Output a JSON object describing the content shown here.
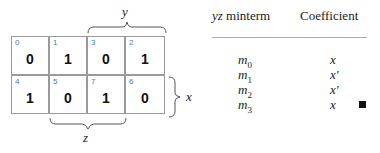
{
  "kmap": {
    "rows": [
      [
        {
          "index": "0",
          "value": "0"
        },
        {
          "index": "1",
          "value": "1"
        },
        {
          "index": "3",
          "value": "0"
        },
        {
          "index": "2",
          "value": "1"
        }
      ],
      [
        {
          "index": "4",
          "value": "1"
        },
        {
          "index": "5",
          "value": "0"
        },
        {
          "index": "7",
          "value": "1"
        },
        {
          "index": "6",
          "value": "0"
        }
      ]
    ],
    "labels": {
      "y": "y",
      "x": "x",
      "z": "z"
    },
    "colors": {
      "index": "#4a78c2",
      "grid": "#9a9a9a"
    }
  },
  "table": {
    "headers": {
      "col1_var": "yz",
      "col1_rest": " minterm",
      "col2": "Coefficient"
    },
    "rule_color": "#8fb3cf",
    "rows": [
      {
        "m": "m",
        "sub": "0",
        "coef": "x"
      },
      {
        "m": "m",
        "sub": "1",
        "coef": "x′"
      },
      {
        "m": "m",
        "sub": "2",
        "coef": "x′"
      },
      {
        "m": "m",
        "sub": "3",
        "coef": "x"
      }
    ],
    "end_mark": "■"
  }
}
